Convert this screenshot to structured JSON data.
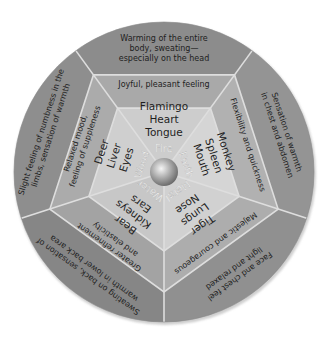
{
  "diagram": {
    "colors": {
      "outer_ring": "#8c8c8c",
      "middle_ring": "#a9a9a9",
      "inner_ring": "#cdcdcd",
      "divider": "#dedede",
      "center_ball": "#9a9a9a",
      "text": "#1e1e1e",
      "element_text": "#f2f2f2"
    },
    "sectors": [
      {
        "element": "Fire",
        "items": [
          "Tongue",
          "Heart",
          "Flamingo"
        ],
        "feeling": [
          "Joyful, pleasant feeling"
        ],
        "sensation": [
          "Warming of the entire",
          "body, sweating—",
          "especially on the head"
        ]
      },
      {
        "element": "Earth",
        "items": [
          "Mouth",
          "Spleen",
          "Monkey"
        ],
        "feeling": [
          "Flexibility and quickness"
        ],
        "sensation": [
          "Sensation of warmth",
          "in chest and abdomen"
        ]
      },
      {
        "element": "Metal",
        "items": [
          "Nose",
          "Lungs",
          "Tiger"
        ],
        "feeling": [
          "Majestic and courageous"
        ],
        "sensation": [
          "Face and chest feel",
          "light and relaxed"
        ]
      },
      {
        "element": "Water",
        "items": [
          "Ears",
          "Kidneys",
          "Bear"
        ],
        "feeling": [
          "Greater refinement",
          "and elasticity"
        ],
        "sensation": [
          "Sweating on back, sensation of",
          "warmth in lower back area"
        ]
      },
      {
        "element": "Wood",
        "items": [
          "Eyes",
          "Liver",
          "Deer"
        ],
        "feeling": [
          "Relaxed mood,",
          "feeling of suppleness"
        ],
        "sensation": [
          "Slight feeling of numbness in the",
          "limbs, sensation of warmth"
        ]
      }
    ]
  }
}
